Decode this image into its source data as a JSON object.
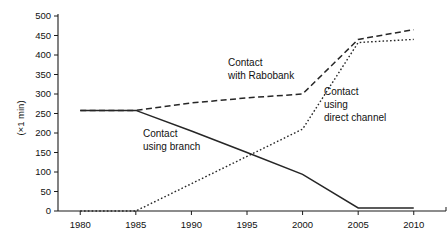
{
  "chart_data": {
    "type": "line",
    "title": "",
    "xlabel": "",
    "ylabel": "(×1 min)",
    "x": [
      1980,
      1985,
      1990,
      1995,
      2000,
      2005,
      2010
    ],
    "xlim": [
      1978,
      2012
    ],
    "ylim": [
      0,
      500
    ],
    "xticks": [
      "1980",
      "1985",
      "1990",
      "1995",
      "2000",
      "2005",
      "2010"
    ],
    "yticks": [
      "0",
      "50",
      "100",
      "150",
      "200",
      "250",
      "300",
      "350",
      "400",
      "450",
      "500"
    ],
    "grid": false,
    "legend_position": "inline-annotations",
    "series": [
      {
        "name": "Contact using branch",
        "style": "solid",
        "color": "#262626",
        "x": [
          1980,
          1985,
          1990,
          1995,
          2000,
          2005,
          2010
        ],
        "values": [
          258,
          258,
          205,
          150,
          94,
          8,
          8
        ]
      },
      {
        "name": "Contact with Rabobank",
        "style": "dashed",
        "color": "#262626",
        "x": [
          1980,
          1985,
          1990,
          1995,
          2000,
          2005,
          2010
        ],
        "values": [
          258,
          258,
          277,
          290,
          300,
          440,
          465
        ]
      },
      {
        "name": "Contact using direct channel",
        "style": "dotted",
        "color": "#262626",
        "x": [
          1980,
          1985,
          1990,
          1995,
          2000,
          2005,
          2010
        ],
        "values": [
          0,
          0,
          70,
          140,
          210,
          432,
          440
        ]
      }
    ],
    "annotations": [
      {
        "id": "rabobank",
        "lines": [
          "Contact",
          "with Rabobank"
        ]
      },
      {
        "id": "direct-channel",
        "lines": [
          "Contact",
          "using",
          "direct channel"
        ]
      },
      {
        "id": "branch",
        "lines": [
          "Contact",
          "using branch"
        ]
      }
    ]
  }
}
